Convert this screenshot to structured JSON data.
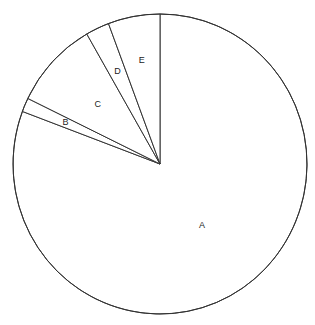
{
  "chart_data": {
    "type": "pie",
    "title": "",
    "categories": [
      "A",
      "B",
      "C",
      "D",
      "E"
    ],
    "values": [
      80.7,
      1.5,
      9.5,
      2.6,
      5.7
    ],
    "unit": "percent (estimated)",
    "start_angle": "12 o'clock",
    "direction": "clockwise",
    "labels": [
      "A",
      "B",
      "C",
      "D",
      "E"
    ],
    "legend": "none",
    "colors": {
      "fill": "#ffffff",
      "stroke": "#333333",
      "label": "#222222"
    }
  }
}
